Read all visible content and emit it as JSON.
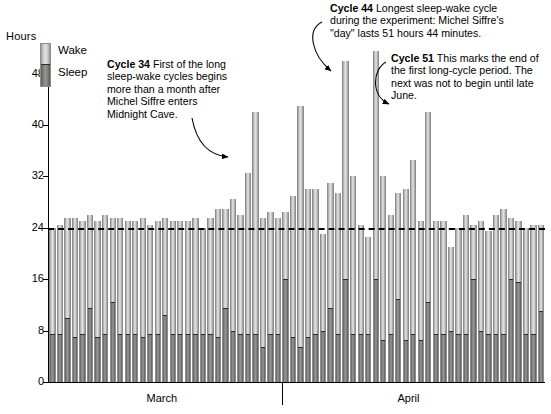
{
  "axes": {
    "y_title": "Hours",
    "y_ticks": [
      0,
      8,
      16,
      24,
      32,
      40,
      48
    ],
    "x_labels": [
      "March",
      "April"
    ]
  },
  "legend": {
    "wake_label": "Wake",
    "sleep_label": "Sleep"
  },
  "annotations": [
    {
      "id": "cycle-34",
      "bold": "Cycle 34",
      "text": "First of the long sleep-wake cycles begins more than a month after Michel Siffre enters Midnight Cave."
    },
    {
      "id": "cycle-44",
      "bold": "Cycle 44",
      "text": "Longest sleep-wake cycle during the experiment: Michel Siffre's \"day\" lasts 51 hours 44 minutes."
    },
    {
      "id": "cycle-51",
      "bold": "Cycle 51",
      "text": "This marks the end of the first long-cycle period. The next was not to begin until late June."
    }
  ],
  "colors": {
    "wake": "#d2d2d2",
    "sleep": "#7c7c7c",
    "axis": "#000000",
    "reference_line": "#000000"
  },
  "chart_data": {
    "type": "bar",
    "title": "",
    "subtitle": "",
    "xlabel": "",
    "ylabel": "Hours",
    "ylim": [
      0,
      52
    ],
    "yticks": [
      0,
      8,
      16,
      24,
      32,
      40,
      48
    ],
    "grid": false,
    "legend_position": "top-left",
    "stacked": true,
    "reference_lines": [
      {
        "y": 24,
        "style": "dashed",
        "label": ""
      }
    ],
    "x_group_labels": [
      "March",
      "April"
    ],
    "x_group_split_index": 31,
    "categories": [
      "1",
      "2",
      "3",
      "4",
      "5",
      "6",
      "7",
      "8",
      "9",
      "10",
      "11",
      "12",
      "13",
      "14",
      "15",
      "16",
      "17",
      "18",
      "19",
      "20",
      "21",
      "22",
      "23",
      "24",
      "25",
      "26",
      "27",
      "28",
      "29",
      "30",
      "31",
      "32",
      "33",
      "34",
      "35",
      "36",
      "37",
      "38",
      "39",
      "40",
      "41",
      "42",
      "43",
      "44",
      "45",
      "46",
      "47",
      "48",
      "49",
      "50",
      "51",
      "52",
      "53",
      "54",
      "55",
      "56",
      "57",
      "58",
      "59",
      "60",
      "61",
      "62",
      "63",
      "64",
      "65",
      "66"
    ],
    "series": [
      {
        "name": "Sleep",
        "color": "#7c7c7c",
        "values": [
          7.5,
          7.5,
          10.0,
          7.0,
          7.5,
          11.5,
          7.0,
          7.5,
          12.5,
          7.5,
          7.5,
          7.5,
          7.0,
          7.5,
          7.5,
          10.5,
          7.5,
          7.5,
          7.5,
          7.5,
          7.5,
          7.5,
          7.0,
          11.5,
          8.0,
          7.5,
          7.5,
          7.5,
          5.5,
          7.5,
          7.5,
          16.0,
          7.0,
          5.5,
          7.0,
          7.5,
          8.0,
          11.5,
          7.5,
          16.0,
          7.5,
          7.5,
          7.5,
          16.0,
          6.5,
          7.5,
          13.0,
          6.5,
          7.5,
          6.5,
          12.5,
          7.5,
          7.5,
          8.0,
          7.5,
          7.5,
          16.0,
          8.0,
          7.5,
          7.5,
          7.5,
          16.0,
          15.5,
          7.5,
          7.5,
          11.0
        ]
      },
      {
        "name": "Wake",
        "color": "#d2d2d2",
        "values": [
          16.5,
          17.0,
          15.5,
          18.5,
          17.5,
          14.5,
          18.0,
          18.5,
          13.0,
          18.0,
          17.5,
          17.5,
          18.5,
          17.0,
          17.5,
          15.0,
          17.5,
          17.5,
          17.5,
          18.0,
          16.5,
          18.0,
          20.0,
          15.5,
          20.5,
          18.5,
          25.0,
          34.5,
          20.0,
          19.0,
          18.0,
          10.5,
          22.0,
          37.5,
          23.0,
          22.5,
          15.0,
          19.5,
          22.0,
          34.0,
          24.5,
          17.0,
          15.0,
          35.5,
          25.5,
          18.5,
          16.5,
          23.5,
          27.0,
          18.5,
          29.5,
          17.5,
          17.5,
          13.0,
          16.5,
          18.5,
          8.5,
          17.0,
          16.0,
          18.5,
          19.5,
          9.5,
          9.5,
          16.5,
          17.0,
          13.5
        ]
      }
    ],
    "totals": [
      24.0,
      24.5,
      25.5,
      25.5,
      25.0,
      26.0,
      25.0,
      26.0,
      25.5,
      25.5,
      25.0,
      25.0,
      25.5,
      24.5,
      25.0,
      25.5,
      25.0,
      25.0,
      25.0,
      25.5,
      24.0,
      25.5,
      27.0,
      27.0,
      28.5,
      26.0,
      32.5,
      42.0,
      25.5,
      26.5,
      25.5,
      26.5,
      29.0,
      43.0,
      30.0,
      30.0,
      23.0,
      31.0,
      29.5,
      50.0,
      32.0,
      24.5,
      22.5,
      51.5,
      32.0,
      26.0,
      29.5,
      30.0,
      34.5,
      25.0,
      42.0,
      25.0,
      25.0,
      21.0,
      24.0,
      26.0,
      24.5,
      25.0,
      23.5,
      26.0,
      27.0,
      25.5,
      25.0,
      24.0,
      24.5,
      24.5
    ]
  }
}
